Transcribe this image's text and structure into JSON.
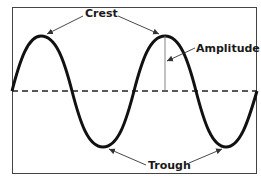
{
  "diagram": {
    "labels": {
      "crest": "Crest",
      "amplitude": "Amplitude",
      "trough": "Trough"
    },
    "colors": {
      "wave": "#111111",
      "frame": "#333333",
      "baseline": "#222222",
      "arrow": "#333333",
      "background": "#ffffff"
    },
    "elements": {
      "wave_type": "sine",
      "crests": 2,
      "troughs": 2,
      "baseline_style": "dashed"
    }
  }
}
